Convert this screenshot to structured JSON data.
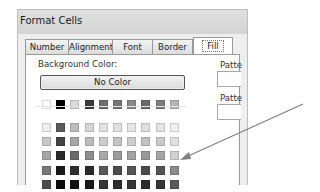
{
  "dialog": {
    "title": "Format Cells",
    "tabs": [
      {
        "label": "Number",
        "active": false
      },
      {
        "label": "Alignment",
        "active": false
      },
      {
        "label": "Font",
        "active": false
      },
      {
        "label": "Border",
        "active": false
      },
      {
        "label": "Fill",
        "active": true
      }
    ],
    "background_color_label": "Background Color:",
    "no_color_button": "No Color",
    "pattern_color_label": "Patte",
    "pattern_style_label": "Patte",
    "theme_row": [
      "#ffffff",
      "#000000",
      "#d8d8d8",
      "#3a3a3a",
      "#6e6e6e",
      "#767676",
      "#8a8a8a",
      "#6a6a6a",
      "#7e7e7e",
      "#b4b4b4"
    ],
    "swatch_rows": [
      [
        "#eeeeee",
        "#5a5a5a",
        "#bdbdbd",
        "#d6d6d6",
        "#e2e2e2",
        "#e0e0e0",
        "#e6e6e6",
        "#dedede",
        "#e4e4e4",
        "#efefef"
      ],
      [
        "#c8c8c8",
        "#444444",
        "#a6a6a6",
        "#bcbcbc",
        "#cccccc",
        "#c4c4c4",
        "#cecece",
        "#c2c2c2",
        "#cacaca",
        "#e0e0e0"
      ],
      [
        "#a6a6a6",
        "#2a2a2a",
        "#6a6a6a",
        "#8e8e8e",
        "#a8a8a8",
        "#9c9c9c",
        "#a4a4a4",
        "#9a9a9a",
        "#a6a6a6",
        "#d0d0d0"
      ],
      [
        "#7a7a7a",
        "#1a1a1a",
        "#2e2e2e",
        "#2a2a2a",
        "#5a5a5a",
        "#4c4c4c",
        "#565656",
        "#4a4a4a",
        "#545454",
        "#8a8a8a"
      ],
      [
        "#4e4e4e",
        "#0c0c0c",
        "#141414",
        "#1a1a1a",
        "#363636",
        "#2e2e2e",
        "#363636",
        "#2c2c2c",
        "#363636",
        "#5a5a5a"
      ]
    ]
  },
  "annotation": {
    "type": "arrow",
    "color": "#808080"
  }
}
